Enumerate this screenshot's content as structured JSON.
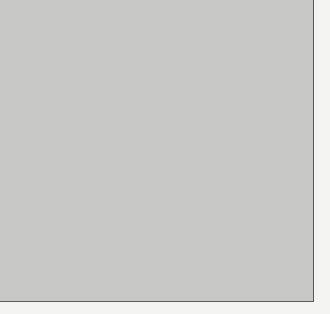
{
  "chart_data": {
    "type": "stem",
    "title": "",
    "xlabel": "m",
    "ylabel": "",
    "x": [
      -12,
      -10,
      -8,
      -6,
      -4,
      -2,
      0,
      2,
      4,
      6,
      8,
      10,
      12
    ],
    "values": [
      0.005,
      0.015,
      0.033,
      0.073,
      0.122,
      0.161,
      0.176,
      0.157,
      0.115,
      0.066,
      0.028,
      0.013,
      0.002
    ],
    "envelope": {
      "type": "gaussian",
      "style": "dashed",
      "peak": 0.176,
      "center": 0,
      "sigma": 4.5
    },
    "x_ticks": [
      -10,
      0,
      10
    ],
    "x_tick_labels": [
      "− 10",
      "0",
      "10"
    ],
    "y_ticks": [
      0,
      0.05,
      0.1,
      0.15
    ],
    "y_tick_labels": [
      "0",
      "0.05",
      "0.10",
      "0.15"
    ],
    "xlim": [
      -17,
      18
    ],
    "ylim": [
      0,
      0.183
    ],
    "grid": false,
    "legend": null,
    "annotations": [
      {
        "type": "arrow",
        "direction": "up",
        "position": "upper-left"
      }
    ]
  },
  "colors": {
    "background": "#c8c8c6",
    "axis": "#4a4a4a",
    "stem": "#4a4a4a",
    "curve": "#555555",
    "frame_top": "#6a6aa0"
  }
}
